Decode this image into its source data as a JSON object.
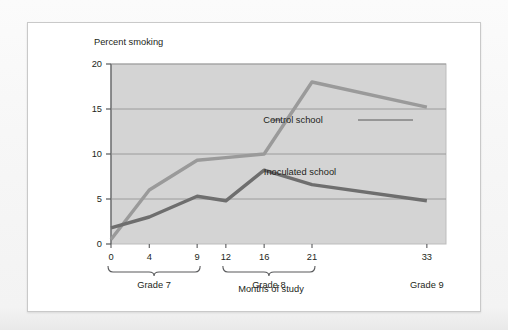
{
  "chart_data": {
    "type": "line",
    "title": "",
    "ylabel": "Percent smoking",
    "xlabel": "Months of study",
    "ylim": [
      0,
      20
    ],
    "xlim": [
      0,
      35
    ],
    "yticks": [
      0,
      5,
      10,
      15,
      20
    ],
    "ytick_labels": [
      "0",
      "5",
      "10",
      "15",
      "20"
    ],
    "xticks": [
      0,
      4,
      9,
      12,
      16,
      21,
      33
    ],
    "xtick_labels": [
      "0",
      "4",
      "9",
      "12",
      "16",
      "21",
      "33"
    ],
    "grid": "horizontal",
    "legend_position": "inline-annotation",
    "plot_background": "#d4d4d4",
    "series": [
      {
        "name": "Control school",
        "color": "#9a9a9a",
        "x": [
          0,
          4,
          9,
          12,
          16,
          21,
          33
        ],
        "values": [
          0.5,
          6.0,
          9.3,
          9.6,
          10.0,
          18.0,
          15.2
        ]
      },
      {
        "name": "Inoculated school",
        "color": "#6e6e6e",
        "x": [
          0,
          4,
          9,
          12,
          16,
          21,
          33
        ],
        "values": [
          1.8,
          3.0,
          5.3,
          4.8,
          8.2,
          6.6,
          4.8
        ]
      }
    ],
    "groups": [
      {
        "label": "Grade 7",
        "from": 0,
        "to": 9,
        "bracket": true
      },
      {
        "label": "Grade 8",
        "from": 12,
        "to": 21,
        "bracket": true
      },
      {
        "label": "Grade 9",
        "at": 33,
        "bracket": false
      }
    ],
    "annotations": [
      {
        "text": "Control school",
        "series": "Control school"
      },
      {
        "text": "Inoculated school",
        "series": "Inoculated school"
      }
    ]
  }
}
